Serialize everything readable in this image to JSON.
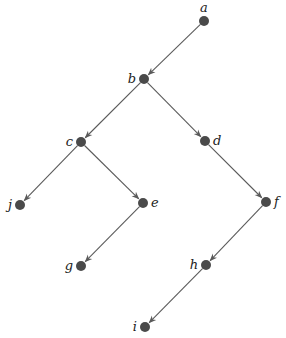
{
  "diagram": {
    "type": "directed-tree",
    "node_color": "#4a4a4a",
    "edge_color": "#5a5a5a",
    "nodes": [
      {
        "id": "a",
        "label": "a",
        "x": 204,
        "y": 21,
        "label_pos": "top"
      },
      {
        "id": "b",
        "label": "b",
        "x": 144,
        "y": 79,
        "label_pos": "left"
      },
      {
        "id": "c",
        "label": "c",
        "x": 81,
        "y": 142,
        "label_pos": "left"
      },
      {
        "id": "d",
        "label": "d",
        "x": 205,
        "y": 141,
        "label_pos": "right"
      },
      {
        "id": "j",
        "label": "j",
        "x": 20,
        "y": 205,
        "label_pos": "left"
      },
      {
        "id": "e",
        "label": "e",
        "x": 143,
        "y": 203,
        "label_pos": "right"
      },
      {
        "id": "f",
        "label": "f",
        "x": 266,
        "y": 202,
        "label_pos": "right"
      },
      {
        "id": "g",
        "label": "g",
        "x": 81,
        "y": 266,
        "label_pos": "left"
      },
      {
        "id": "h",
        "label": "h",
        "x": 206,
        "y": 265,
        "label_pos": "left"
      },
      {
        "id": "i",
        "label": "i",
        "x": 145,
        "y": 327,
        "label_pos": "left"
      }
    ],
    "edges": [
      {
        "from": "a",
        "to": "b"
      },
      {
        "from": "b",
        "to": "c"
      },
      {
        "from": "b",
        "to": "d"
      },
      {
        "from": "c",
        "to": "j"
      },
      {
        "from": "c",
        "to": "e"
      },
      {
        "from": "e",
        "to": "g"
      },
      {
        "from": "d",
        "to": "f"
      },
      {
        "from": "f",
        "to": "h"
      },
      {
        "from": "h",
        "to": "i"
      }
    ]
  }
}
